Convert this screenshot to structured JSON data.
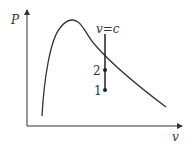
{
  "diagram": {
    "y_axis_label": "P",
    "x_axis_label": "v",
    "line_label": "v=c",
    "points": [
      {
        "label": "2",
        "x": 105,
        "y": 70
      },
      {
        "label": "1",
        "x": 105,
        "y": 90
      }
    ],
    "colors": {
      "stroke": "#333333",
      "background": "#ffffff"
    }
  }
}
